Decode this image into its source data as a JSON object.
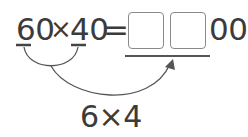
{
  "equation": {
    "left_factor": "60",
    "times": "×",
    "right_factor": "40",
    "equals": "=",
    "answer_boxes": [
      "",
      ""
    ],
    "answer_suffix": "00"
  },
  "hint": {
    "text": "6×4"
  },
  "colors": {
    "text": "#3b3b3b",
    "box_border": "#8a8a8a",
    "line": "#555555"
  }
}
